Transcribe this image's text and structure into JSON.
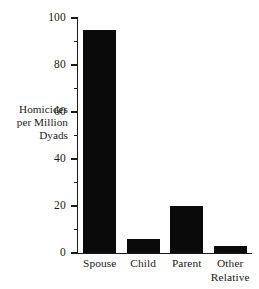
{
  "chart_data": {
    "type": "bar",
    "title": "",
    "xlabel": "",
    "ylabel": "Homicides per Million Dyads",
    "ylabel_lines": [
      "Homicides",
      "per Million",
      "Dyads"
    ],
    "categories": [
      "Spouse",
      "Child",
      "Parent",
      "Other Relative"
    ],
    "category_lines": [
      [
        "Spouse"
      ],
      [
        "Child"
      ],
      [
        "Parent"
      ],
      [
        "Other",
        "Relative"
      ]
    ],
    "values": [
      95,
      6,
      20,
      3
    ],
    "ylim": [
      0,
      100
    ],
    "xlim": [
      0,
      4
    ],
    "y_major_ticks": [
      0,
      20,
      40,
      60,
      80,
      100
    ],
    "y_major_tick_labels": [
      "0",
      "20",
      "40",
      "60",
      "80",
      "100"
    ],
    "y_minor_ticks": [
      10,
      30,
      50,
      70,
      90
    ],
    "grid": false,
    "legend": null,
    "legend_position": "none",
    "bar_color": "#0a0a0a",
    "axis_color": "#1a1a1a",
    "background_color": "#ffffff",
    "tick_direction": "out",
    "spines": [
      "left",
      "bottom"
    ]
  }
}
